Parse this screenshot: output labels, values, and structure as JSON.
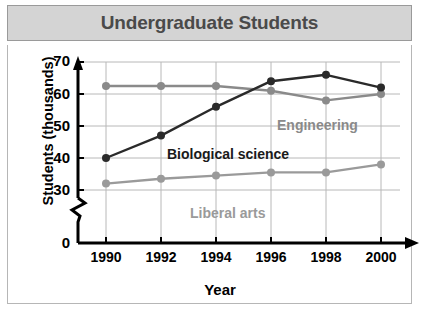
{
  "title": "Undergraduate Students",
  "colors": {
    "banner_bg": "#d4d4d4",
    "title_text": "#4a4a4a",
    "grid": "#b8b8b8",
    "axis": "#000000",
    "engineering": "#8a8a8a",
    "biological": "#2a2a2a",
    "liberal_arts": "#9a9a9a"
  },
  "axis": {
    "y_label": "Students (thousands)",
    "x_label": "Year",
    "y_ticks": [
      "70",
      "60",
      "50",
      "40",
      "30",
      "0"
    ],
    "x_ticks": [
      "1990",
      "1992",
      "1994",
      "1996",
      "1998",
      "2000"
    ],
    "y_axis_break": true
  },
  "series_labels": {
    "engineering": "Engineering",
    "biological": "Biological science",
    "liberal_arts": "Liberal arts"
  },
  "chart_data": {
    "type": "line",
    "title": "Undergraduate Students",
    "xlabel": "Year",
    "ylabel": "Students (thousands)",
    "x": [
      1990,
      1992,
      1994,
      1996,
      1998,
      2000
    ],
    "categories": [
      "1990",
      "1992",
      "1994",
      "1996",
      "1998",
      "2000"
    ],
    "ylim": [
      30,
      70
    ],
    "yticks": [
      30,
      40,
      50,
      60,
      70
    ],
    "y_axis_break_below": 30,
    "grid": true,
    "legend": "inline-labels",
    "series": [
      {
        "name": "Engineering",
        "color": "#8a8a8a",
        "values": [
          62.5,
          62.5,
          62.5,
          61,
          58,
          60
        ]
      },
      {
        "name": "Biological science",
        "color": "#2a2a2a",
        "values": [
          40,
          47,
          56,
          64,
          66,
          62
        ]
      },
      {
        "name": "Liberal arts",
        "color": "#9a9a9a",
        "values": [
          32,
          33.5,
          34.5,
          35.5,
          35.5,
          38
        ]
      }
    ]
  }
}
